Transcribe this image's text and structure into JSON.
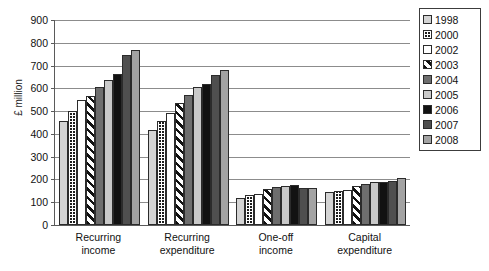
{
  "chart_data": {
    "type": "bar",
    "title": "",
    "subtitle": "",
    "xlabel": "",
    "ylabel": "£ million",
    "ylim": [
      0,
      900
    ],
    "ytick_step": 100,
    "yticks": [
      900,
      800,
      700,
      600,
      500,
      400,
      300,
      200,
      100,
      0
    ],
    "grid": true,
    "legend_position": "right",
    "categories": [
      "Recurring income",
      "Recurring expenditure",
      "One-off income",
      "Capital expenditure"
    ],
    "category_lines": [
      [
        "Recurring",
        "income"
      ],
      [
        "Recurring",
        "expenditure"
      ],
      [
        "One-off",
        "income"
      ],
      [
        "Capital",
        "expenditure"
      ]
    ],
    "series": [
      {
        "name": "1998",
        "fill": "light-gray",
        "values": [
          455,
          415,
          120,
          145
        ]
      },
      {
        "name": "2000",
        "fill": "dark-grid",
        "values": [
          500,
          455,
          130,
          150
        ]
      },
      {
        "name": "2002",
        "fill": "white",
        "values": [
          548,
          490,
          135,
          155
        ]
      },
      {
        "name": "2003",
        "fill": "diagonal-hatch",
        "values": [
          568,
          535,
          160,
          170
        ]
      },
      {
        "name": "2004",
        "fill": "medium-dark-gray",
        "values": [
          608,
          570,
          168,
          178
        ]
      },
      {
        "name": "2005",
        "fill": "light-gray-2",
        "values": [
          638,
          605,
          170,
          190
        ]
      },
      {
        "name": "2006",
        "fill": "black",
        "values": [
          662,
          620,
          175,
          190
        ]
      },
      {
        "name": "2007",
        "fill": "dark-gray",
        "values": [
          745,
          658,
          162,
          195
        ]
      },
      {
        "name": "2008",
        "fill": "medium-gray",
        "values": [
          770,
          680,
          162,
          205
        ]
      }
    ]
  },
  "legend": {
    "items": [
      {
        "label": "1998"
      },
      {
        "label": "2000"
      },
      {
        "label": "2002"
      },
      {
        "label": "2003"
      },
      {
        "label": "2004"
      },
      {
        "label": "2005"
      },
      {
        "label": "2006"
      },
      {
        "label": "2007"
      },
      {
        "label": "2008"
      }
    ]
  },
  "colors": {
    "axis": "#5a5a5a",
    "gridline": "#8c8c8c",
    "text": "#111111",
    "background": "#ffffff"
  }
}
